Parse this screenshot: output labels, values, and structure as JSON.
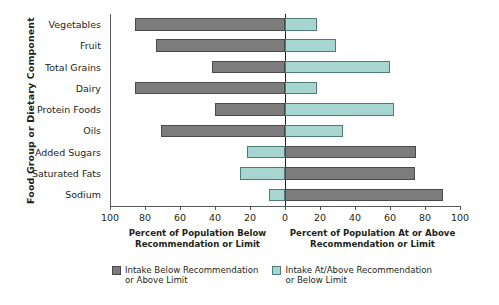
{
  "chart_data": {
    "type": "bar",
    "title": "",
    "orientation": "horizontal",
    "style": "diverging-bidirectional",
    "ylabel": "Food Group or Dietary Component",
    "xlabel_left": "Percent of Population Below\nRecommendation or Limit",
    "xlabel_right": "Percent of Population At or\nAbove Recommendation or Limit",
    "categories": [
      "Vegetables",
      "Fruit",
      "Total Grains",
      "Dairy",
      "Protein Foods",
      "Oils",
      "Added Sugars",
      "Saturated Fats",
      "Sodium"
    ],
    "xlim_left": [
      100,
      0
    ],
    "xlim_right": [
      0,
      100
    ],
    "xticks_left": [
      100,
      80,
      60,
      40,
      20,
      0
    ],
    "xticks_right": [
      0,
      20,
      40,
      60,
      80,
      100
    ],
    "grid": false,
    "legend_position": "bottom",
    "series": [
      {
        "name": "Intake Below Recommendation or Above Limit",
        "color": "#7c7c7c",
        "values": [
          86,
          74,
          42,
          86,
          40,
          71,
          75,
          74,
          90
        ],
        "side": [
          "left",
          "left",
          "left",
          "left",
          "left",
          "left",
          "right",
          "right",
          "right"
        ]
      },
      {
        "name": "Intake At/Above Recommendation or Below Limit",
        "color": "#a7d5d0",
        "values": [
          18,
          29,
          60,
          18,
          62,
          33,
          22,
          26,
          9
        ],
        "side": [
          "right",
          "right",
          "right",
          "right",
          "right",
          "right",
          "left",
          "left",
          "left"
        ]
      }
    ],
    "rows": [
      {
        "category": "Vegetables",
        "left_value": 86,
        "left_color": "gray",
        "right_value": 18,
        "right_color": "teal"
      },
      {
        "category": "Fruit",
        "left_value": 74,
        "left_color": "gray",
        "right_value": 29,
        "right_color": "teal"
      },
      {
        "category": "Total Grains",
        "left_value": 42,
        "left_color": "gray",
        "right_value": 60,
        "right_color": "teal"
      },
      {
        "category": "Dairy",
        "left_value": 86,
        "left_color": "gray",
        "right_value": 18,
        "right_color": "teal"
      },
      {
        "category": "Protein Foods",
        "left_value": 40,
        "left_color": "gray",
        "right_value": 62,
        "right_color": "teal"
      },
      {
        "category": "Oils",
        "left_value": 71,
        "left_color": "gray",
        "right_value": 33,
        "right_color": "teal"
      },
      {
        "category": "Added Sugars",
        "left_value": 22,
        "left_color": "teal",
        "right_value": 75,
        "right_color": "gray"
      },
      {
        "category": "Saturated Fats",
        "left_value": 26,
        "left_color": "teal",
        "right_value": 74,
        "right_color": "gray"
      },
      {
        "category": "Sodium",
        "left_value": 9,
        "left_color": "teal",
        "right_value": 90,
        "right_color": "gray"
      }
    ],
    "legend": [
      {
        "swatch": "gray",
        "label": "Intake Below Recommendation\nor Above Limit"
      },
      {
        "swatch": "teal",
        "label": "Intake At/Above Recommendation\nor Below Limit"
      }
    ]
  },
  "axis": {
    "y_title": "Food Group or Dietary Component",
    "left_caption": "Percent of Population Below\nRecommendation or Limit",
    "right_caption": "Percent of Population At or\nAbove Recommendation or Limit",
    "tick_labels": [
      "100",
      "80",
      "60",
      "40",
      "20",
      "0",
      "20",
      "40",
      "60",
      "80",
      "100"
    ]
  }
}
